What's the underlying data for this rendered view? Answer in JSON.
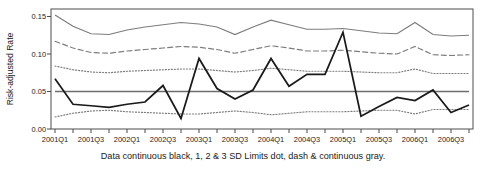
{
  "figure": {
    "caption": "Data continuous black, 1, 2 & 3 SD Limits dot, dash & continuous gray.",
    "ylabel": "Risk-adjusted Rate"
  },
  "colors": {
    "data_line": "#1a1a1a",
    "limit_gray": "#7d7d7d",
    "center_line": "#6e6e6e",
    "axis": "#4d4d4d",
    "background": "#ffffff"
  },
  "chart_data": {
    "type": "line",
    "title": "",
    "xlabel": "",
    "ylabel": "Risk-adjusted Rate",
    "xlim": [
      0,
      23
    ],
    "ylim": [
      0.0,
      0.16
    ],
    "yticks": [
      0.0,
      0.05,
      0.1,
      0.15
    ],
    "ytick_labels": [
      "0.00",
      "0.05",
      "0.10",
      "0.15"
    ],
    "grid": false,
    "legend": "none",
    "x": [
      "2001Q1",
      "2001Q2",
      "2001Q3",
      "2001Q4",
      "2002Q1",
      "2002Q2",
      "2002Q3",
      "2002Q4",
      "2003Q1",
      "2003Q2",
      "2003Q3",
      "2003Q4",
      "2004Q1",
      "2004Q2",
      "2004Q3",
      "2004Q4",
      "2005Q1",
      "2005Q2",
      "2005Q3",
      "2005Q4",
      "2006Q1",
      "2006Q2",
      "2006Q3",
      "2006Q4"
    ],
    "xtick_labels_shown": [
      "2001Q1",
      "2001Q3",
      "2002Q1",
      "2002Q3",
      "2003Q1",
      "2003Q3",
      "2004Q1",
      "2004Q3",
      "2005Q1",
      "2005Q3",
      "2006Q1",
      "2006Q3"
    ],
    "series": [
      {
        "name": "Data",
        "style": "continuous black",
        "color": "#1a1a1a",
        "values": [
          0.067,
          0.033,
          0.031,
          0.029,
          0.033,
          0.036,
          0.058,
          0.014,
          0.094,
          0.054,
          0.04,
          0.052,
          0.094,
          0.057,
          0.073,
          0.073,
          0.129,
          0.017,
          0.03,
          0.042,
          0.038,
          0.052,
          0.022,
          0.032
        ]
      },
      {
        "name": "3 SD Upper Limit",
        "style": "continuous gray",
        "color": "#7d7d7d",
        "values": [
          0.152,
          0.137,
          0.127,
          0.126,
          0.132,
          0.136,
          0.139,
          0.142,
          0.14,
          0.136,
          0.126,
          0.136,
          0.145,
          0.139,
          0.133,
          0.133,
          0.134,
          0.131,
          0.128,
          0.127,
          0.142,
          0.126,
          0.124,
          0.125
        ]
      },
      {
        "name": "2 SD Upper Limit",
        "style": "dash gray",
        "color": "#7d7d7d",
        "values": [
          0.117,
          0.108,
          0.102,
          0.101,
          0.104,
          0.106,
          0.108,
          0.11,
          0.109,
          0.106,
          0.101,
          0.106,
          0.111,
          0.108,
          0.104,
          0.104,
          0.105,
          0.103,
          0.101,
          0.1,
          0.11,
          0.099,
          0.098,
          0.099
        ]
      },
      {
        "name": "1 SD Upper Limit",
        "style": "dot gray",
        "color": "#7d7d7d",
        "values": [
          0.084,
          0.079,
          0.076,
          0.075,
          0.077,
          0.078,
          0.079,
          0.08,
          0.08,
          0.078,
          0.076,
          0.078,
          0.081,
          0.079,
          0.077,
          0.077,
          0.077,
          0.076,
          0.075,
          0.075,
          0.08,
          0.074,
          0.074,
          0.074
        ]
      },
      {
        "name": "Center Line",
        "style": "continuous gray",
        "color": "#6e6e6e",
        "values": [
          0.05,
          0.05,
          0.05,
          0.05,
          0.05,
          0.05,
          0.05,
          0.05,
          0.05,
          0.05,
          0.05,
          0.05,
          0.05,
          0.05,
          0.05,
          0.05,
          0.05,
          0.05,
          0.05,
          0.05,
          0.05,
          0.05,
          0.05,
          0.05
        ]
      },
      {
        "name": "1 SD Lower Limit",
        "style": "dot gray",
        "color": "#7d7d7d",
        "values": [
          0.016,
          0.021,
          0.024,
          0.025,
          0.023,
          0.022,
          0.021,
          0.02,
          0.02,
          0.022,
          0.024,
          0.022,
          0.019,
          0.021,
          0.023,
          0.023,
          0.023,
          0.024,
          0.025,
          0.025,
          0.02,
          0.026,
          0.026,
          0.026
        ]
      }
    ]
  }
}
